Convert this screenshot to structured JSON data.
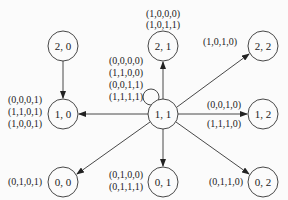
{
  "diagram": {
    "nodes": [
      {
        "id": "2,0",
        "label": "2, 0",
        "x": 63,
        "y": 46
      },
      {
        "id": "2,1",
        "label": "2, 1",
        "x": 163,
        "y": 46
      },
      {
        "id": "2,2",
        "label": "2, 2",
        "x": 263,
        "y": 46
      },
      {
        "id": "1,0",
        "label": "1, 0",
        "x": 63,
        "y": 114
      },
      {
        "id": "1,1",
        "label": "1, 1",
        "x": 163,
        "y": 114
      },
      {
        "id": "1,2",
        "label": "1, 2",
        "x": 263,
        "y": 114
      },
      {
        "id": "0,0",
        "label": "0, 0",
        "x": 63,
        "y": 182
      },
      {
        "id": "0,1",
        "label": "0, 1",
        "x": 163,
        "y": 182
      },
      {
        "id": "0,2",
        "label": "0, 2",
        "x": 263,
        "y": 182
      }
    ],
    "edges": [
      {
        "from": "2,0",
        "to": "1,0"
      },
      {
        "from": "1,1",
        "to": "1,0"
      },
      {
        "from": "1,1",
        "to": "2,1"
      },
      {
        "from": "1,1",
        "to": "2,2"
      },
      {
        "from": "1,1",
        "to": "1,2"
      },
      {
        "from": "1,1",
        "to": "0,0"
      },
      {
        "from": "1,1",
        "to": "0,1"
      },
      {
        "from": "1,1",
        "to": "0,2"
      },
      {
        "from": "1,1",
        "to": "1,1",
        "type": "self-loop"
      }
    ],
    "labels": {
      "self_loop": [
        "(0,0,0,0)",
        "(1,1,0,0)",
        "(0,0,1,1)",
        "(1,1,1,1)"
      ],
      "to_2_1": [
        "(1,0,0,0)",
        "(1,0,1,1)"
      ],
      "to_2_2": [
        "(1,0,1,0)"
      ],
      "to_1_0": [
        "(0,0,0,1)",
        "(1,1,0,1)",
        "(1,0,0,1)"
      ],
      "to_1_2_top": [
        "(0,0,1,0)"
      ],
      "to_1_2_bottom": [
        "(1,1,1,0)"
      ],
      "to_0_0": [
        "(0,1,0,1)"
      ],
      "to_0_1": [
        "(0,1,0,0)",
        "(0,1,1,1)"
      ],
      "to_0_2": [
        "(0,1,1,0)"
      ]
    }
  }
}
